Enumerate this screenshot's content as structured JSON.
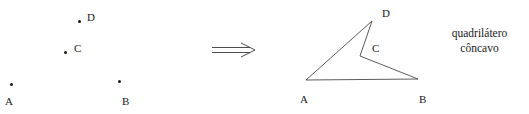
{
  "figure": {
    "width": 529,
    "height": 114,
    "background": "#ffffff",
    "ink_color": "#1a1a1a"
  },
  "left_panel": {
    "name": "four-loose-points",
    "points": [
      {
        "label": "A",
        "dot_x": 10,
        "dot_y": 83,
        "label_x": 5,
        "label_y": 96
      },
      {
        "label": "B",
        "dot_x": 118,
        "dot_y": 80,
        "label_x": 122,
        "label_y": 96
      },
      {
        "label": "C",
        "dot_x": 64,
        "dot_y": 51,
        "label_x": 74,
        "label_y": 43
      },
      {
        "label": "D",
        "dot_x": 78,
        "dot_y": 20,
        "label_x": 87,
        "label_y": 12
      }
    ]
  },
  "arrow": {
    "glyph_name": "double-arrow-right",
    "label": "implies",
    "x1": 4,
    "x2": 46,
    "y": 12
  },
  "right_panel": {
    "name": "concave-quadrilateral",
    "vertices": [
      {
        "label": "A",
        "x": 16,
        "y": 80,
        "label_x": 10,
        "label_y": 94
      },
      {
        "label": "D",
        "x": 82,
        "y": 21,
        "label_x": 92,
        "label_y": 8
      },
      {
        "label": "C",
        "x": 70,
        "y": 56,
        "label_x": 82,
        "label_y": 43
      },
      {
        "label": "B",
        "x": 128,
        "y": 79,
        "label_x": 129,
        "label_y": 94
      }
    ],
    "edge_order": [
      "A",
      "D",
      "C",
      "B"
    ],
    "stroke_color": "#4a4a4a",
    "stroke_width": 0.9,
    "closed": true
  },
  "caption": {
    "line1": "quadrilátero",
    "line2": "côncavo",
    "full_text": "quadrilátero côncavo"
  }
}
